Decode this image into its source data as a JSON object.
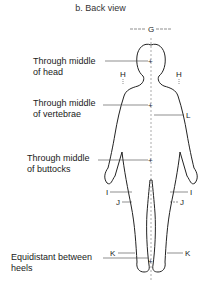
{
  "title": "b. Back view",
  "annotations": [
    {
      "id": "head",
      "line1": "Through middle",
      "line2": "of head"
    },
    {
      "id": "vertebrae",
      "line1": "Through middle",
      "line2": "of vertebrae"
    },
    {
      "id": "buttocks",
      "line1": "Through middle",
      "line2": "of buttocks"
    },
    {
      "id": "heels",
      "line1": "Equidistant between",
      "line2": "heels"
    }
  ],
  "dimension_labels": {
    "G": "G",
    "H": "H",
    "L": "L",
    "I": "I",
    "J": "J",
    "K": "K"
  }
}
